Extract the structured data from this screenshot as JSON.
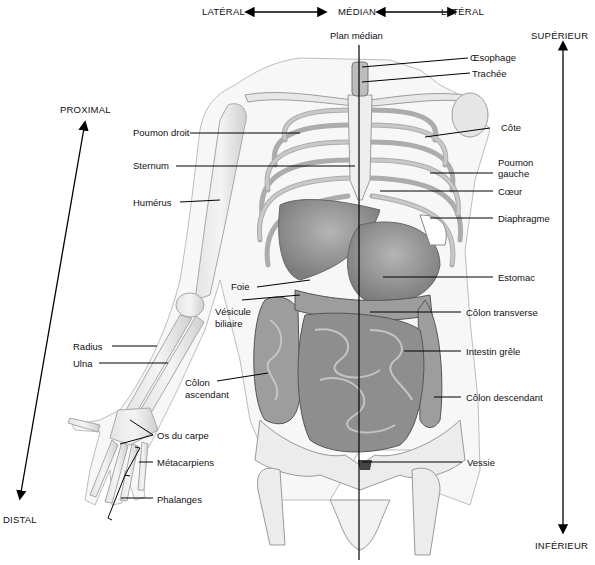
{
  "directions": {
    "lateral_left": "LATÉRAL",
    "median": "MÉDIAN",
    "lateral_right": "LATÉRAL",
    "superior": "SUPÉRIEUR",
    "inferior": "INFÉRIEUR",
    "proximal": "PROXIMAL",
    "distal": "DISTAL"
  },
  "plane_label": "Plan médian",
  "labels_left": {
    "poumon_droit": "Poumon droit",
    "sternum": "Sternum",
    "humerus": "Humérus",
    "foie": "Foie",
    "vesicule_1": "Vésicule",
    "vesicule_2": "biliaire",
    "radius": "Radius",
    "ulna": "Ulna",
    "colon_asc_1": "Côlon",
    "colon_asc_2": "ascendant",
    "os_carpe": "Os du carpe",
    "metacarpiens": "Métacarpiens",
    "phalanges": "Phalanges"
  },
  "labels_right": {
    "oesophage": "Œsophage",
    "trachee": "Trachée",
    "cote": "Côte",
    "poumon_gauche_1": "Poumon",
    "poumon_gauche_2": "gauche",
    "coeur": "Cœur",
    "diaphragme": "Diaphragme",
    "estomac": "Estomac",
    "colon_transverse": "Côlon transverse",
    "intestin_grele": "Intestin grêle",
    "colon_descendant": "Côlon descendant",
    "vessie": "Vessie"
  }
}
